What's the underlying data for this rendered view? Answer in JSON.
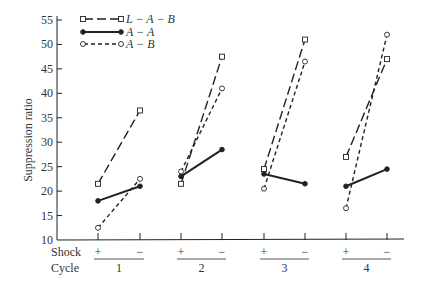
{
  "chart_data": {
    "type": "line",
    "title": "",
    "xlabel": "Cycle",
    "ylabel": "Suppression ratio",
    "ylim": [
      10,
      55
    ],
    "yticks": [
      10,
      15,
      20,
      25,
      30,
      35,
      40,
      45,
      50,
      55
    ],
    "grid": false,
    "legend_position": "top-left",
    "x_rows": {
      "shock_label": "Shock",
      "cycle_label": "Cycle",
      "shock_values": [
        "+",
        "−"
      ],
      "cycles": [
        "1",
        "2",
        "3",
        "4"
      ]
    },
    "categories": [
      "1+",
      "1−",
      "2+",
      "2−",
      "3+",
      "3−",
      "4+",
      "4−"
    ],
    "series": [
      {
        "name": "L − A − B",
        "style": "long-dash",
        "marker": "square-open",
        "values": [
          21.5,
          36.5,
          21.5,
          47.5,
          24.5,
          51,
          27,
          47
        ]
      },
      {
        "name": "A − A",
        "style": "solid",
        "marker": "circle-filled",
        "values": [
          18,
          21,
          23,
          28.5,
          23.5,
          21.5,
          21,
          24.5
        ]
      },
      {
        "name": "A − B",
        "style": "short-dash",
        "marker": "circle-open",
        "values": [
          12.5,
          22.5,
          24,
          41,
          20.5,
          46.5,
          16.5,
          52
        ]
      }
    ]
  },
  "legend": [
    {
      "label": "L − A − B"
    },
    {
      "label": "A − A"
    },
    {
      "label": "A − B"
    }
  ]
}
